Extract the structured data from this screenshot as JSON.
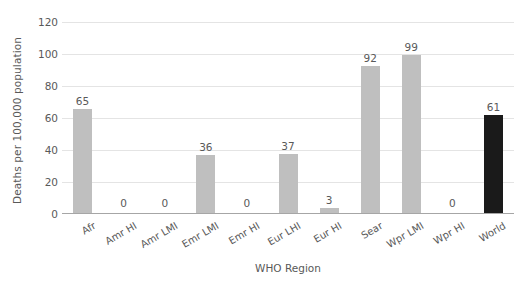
{
  "chart_data": {
    "type": "bar",
    "title": "",
    "subtitle": "",
    "xlabel": "WHO Region",
    "ylabel": "Deaths per 100,000 population",
    "categories": [
      "Afr",
      "Amr HI",
      "Amr LMI",
      "Emr LMI",
      "Emr HI",
      "Eur LHI",
      "Eur HI",
      "Sear",
      "Wpr LMI",
      "Wpr HI",
      "World"
    ],
    "values": [
      65,
      0,
      0,
      36,
      0,
      37,
      3,
      92,
      99,
      0,
      61
    ],
    "data_labels": [
      "65",
      "0",
      "0",
      "36",
      "0",
      "37",
      "3",
      "92",
      "99",
      "0",
      "61"
    ],
    "ylim": [
      0,
      120
    ],
    "yticks": [
      0,
      20,
      40,
      60,
      80,
      100,
      120
    ],
    "ytick_labels": [
      "0",
      "20",
      "40",
      "60",
      "80",
      "100",
      "120"
    ],
    "grid": true,
    "legend": false,
    "legend_position": "none",
    "bar_color": "#BFBFBF",
    "highlight_color": "#1A1A1A",
    "highlight_category": "World",
    "gridline_color": "#E4E4E4",
    "axis_color": "#A6A6A6",
    "text_color": "#595959",
    "background_color": "#FFFFFF"
  }
}
